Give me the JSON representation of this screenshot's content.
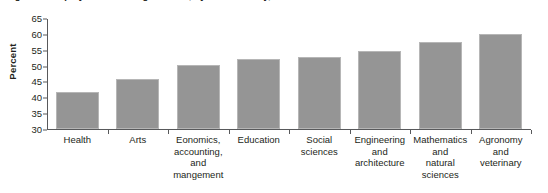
{
  "figure": {
    "caption": "Figure 4. Employment rate of graduates, by field of study, 2011",
    "bar_color": "#959595",
    "axis_color": "#58595b",
    "text_color": "#231f20"
  },
  "chart_data": {
    "type": "bar",
    "title": "",
    "xlabel": "",
    "ylabel": "Percent",
    "ylim": [
      30,
      65
    ],
    "yticks": [
      30,
      35,
      40,
      45,
      50,
      55,
      60,
      65
    ],
    "grid": false,
    "legend": "none",
    "categories": [
      "Health",
      "Arts",
      "Eonomics, accounting, and mangement",
      "Education",
      "Social sciences",
      "Engineering and architecture",
      "Mathematics and natural sciences",
      "Agronomy and veterinary"
    ],
    "category_lines": [
      [
        "Health"
      ],
      [
        "Arts"
      ],
      [
        "Eonomics,",
        "accounting,",
        "and",
        "mangement"
      ],
      [
        "Education"
      ],
      [
        "Social",
        "sciences"
      ],
      [
        "Engineering",
        "and",
        "architecture"
      ],
      [
        "Mathematics",
        "and",
        "natural",
        "sciences"
      ],
      [
        "Agronomy",
        "and",
        "veterinary"
      ]
    ],
    "values": [
      41.7,
      45.8,
      50.2,
      52.0,
      52.7,
      54.7,
      57.3,
      60.0
    ]
  }
}
